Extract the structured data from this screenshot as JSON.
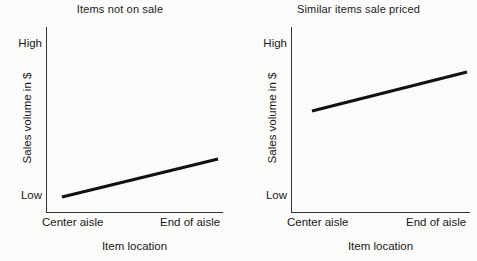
{
  "figure": {
    "background_color": "#fbfbf9",
    "line_color": "#111111",
    "axis_color": "#333333"
  },
  "panels": [
    {
      "title": "Items not on sale",
      "y_axis_label": "Sales volume in $",
      "x_axis_label": "Item location",
      "y_tick_high": "High",
      "y_tick_low": "Low",
      "x_tick_start": "Center aisle",
      "x_tick_end": "End of aisle"
    },
    {
      "title": "Similar items sale priced",
      "y_axis_label": "Sales volume in $",
      "x_axis_label": "Item location",
      "y_tick_high": "High",
      "y_tick_low": "Low",
      "x_tick_start": "Center aisle",
      "x_tick_end": "End of aisle"
    }
  ],
  "chart_data": [
    {
      "type": "line",
      "title": "Items not on sale",
      "xlabel": "Item location",
      "ylabel": "Sales volume in $",
      "categories": [
        "Center aisle",
        "End of aisle"
      ],
      "x_tick_labels": [
        "Center aisle",
        "End of aisle"
      ],
      "y_tick_labels": [
        "Low",
        "High"
      ],
      "ylim": [
        0,
        100
      ],
      "y_tick_values": [
        5,
        100
      ],
      "grid": false,
      "legend": "none",
      "series": [
        {
          "name": "Items not on sale",
          "x": [
            "Center aisle",
            "End of aisle"
          ],
          "values": [
            8,
            29
          ],
          "color": "#111111",
          "linewidth": 3
        }
      ],
      "pixel_endpoints": [
        [
          62,
          197
        ],
        [
          218,
          159
        ]
      ]
    },
    {
      "type": "line",
      "title": "Similar items sale priced",
      "xlabel": "Item location",
      "ylabel": "Sales volume in $",
      "categories": [
        "Center aisle",
        "End of aisle"
      ],
      "x_tick_labels": [
        "Center aisle",
        "End of aisle"
      ],
      "y_tick_labels": [
        "Low",
        "High"
      ],
      "ylim": [
        0,
        100
      ],
      "y_tick_values": [
        5,
        100
      ],
      "grid": false,
      "legend": "none",
      "series": [
        {
          "name": "Similar items sale priced",
          "x": [
            "Center aisle",
            "End of aisle"
          ],
          "values": [
            60,
            85
          ],
          "color": "#111111",
          "linewidth": 3
        }
      ],
      "pixel_endpoints": [
        [
          312,
          111
        ],
        [
          467,
          72
        ]
      ]
    }
  ]
}
